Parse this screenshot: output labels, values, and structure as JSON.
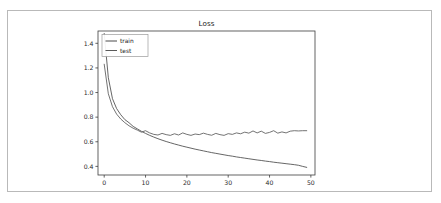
{
  "page": {
    "background_color": "#ffffff",
    "border_color": "#b9b9b9"
  },
  "chart_data": {
    "type": "line",
    "title": "Loss",
    "xlabel": "",
    "ylabel": "",
    "xlim": [
      -1.5,
      51.0
    ],
    "ylim": [
      0.33,
      1.5
    ],
    "xticks": [
      0,
      10,
      20,
      30,
      40,
      50
    ],
    "xtick_labels": [
      "0",
      "10",
      "20",
      "30",
      "40",
      "50"
    ],
    "yticks": [
      0.4,
      0.6,
      0.8,
      1.0,
      1.2,
      1.4
    ],
    "ytick_labels": [
      "0.4",
      "0.6",
      "0.8",
      "1.0",
      "1.2",
      "1.4"
    ],
    "grid": false,
    "legend_position": "upper left",
    "legend_entries": [
      "train",
      "test"
    ],
    "x": [
      0,
      1,
      2,
      3,
      4,
      5,
      6,
      7,
      8,
      9,
      10,
      11,
      12,
      13,
      14,
      15,
      16,
      17,
      18,
      19,
      20,
      21,
      22,
      23,
      24,
      25,
      26,
      27,
      28,
      29,
      30,
      31,
      32,
      33,
      34,
      35,
      36,
      37,
      38,
      39,
      40,
      41,
      42,
      43,
      44,
      45,
      46,
      47,
      48,
      49
    ],
    "series": [
      {
        "name": "train",
        "color": "#4a4a4a",
        "values": [
          1.48,
          1.12,
          0.95,
          0.87,
          0.82,
          0.78,
          0.755,
          0.725,
          0.705,
          0.685,
          0.668,
          0.652,
          0.638,
          0.625,
          0.613,
          0.602,
          0.592,
          0.582,
          0.573,
          0.564,
          0.556,
          0.548,
          0.54,
          0.533,
          0.526,
          0.519,
          0.512,
          0.506,
          0.5,
          0.494,
          0.488,
          0.483,
          0.477,
          0.472,
          0.467,
          0.462,
          0.457,
          0.452,
          0.448,
          0.443,
          0.439,
          0.434,
          0.43,
          0.426,
          0.422,
          0.418,
          0.414,
          0.409,
          0.4,
          0.392
        ]
      },
      {
        "name": "test",
        "color": "#5a5a5a",
        "values": [
          1.23,
          0.99,
          0.885,
          0.825,
          0.785,
          0.755,
          0.73,
          0.71,
          0.695,
          0.678,
          0.69,
          0.672,
          0.66,
          0.655,
          0.668,
          0.658,
          0.652,
          0.665,
          0.655,
          0.672,
          0.66,
          0.652,
          0.663,
          0.658,
          0.67,
          0.66,
          0.653,
          0.668,
          0.658,
          0.652,
          0.666,
          0.66,
          0.672,
          0.665,
          0.678,
          0.67,
          0.688,
          0.672,
          0.686,
          0.668,
          0.676,
          0.69,
          0.67,
          0.68,
          0.672,
          0.686,
          0.69,
          0.688,
          0.69,
          0.69
        ]
      }
    ]
  }
}
